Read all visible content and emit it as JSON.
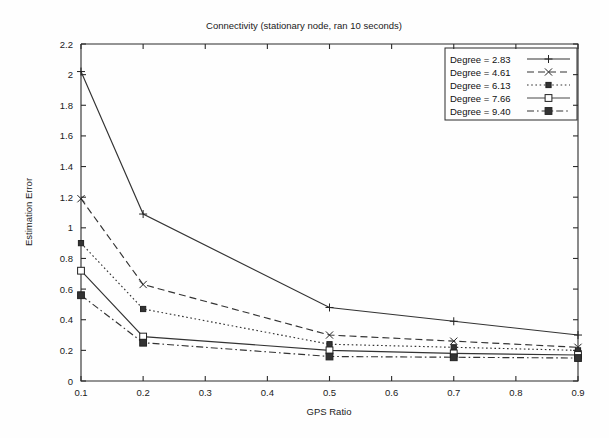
{
  "chart_data": {
    "type": "line",
    "title": "Connectivity (stationary node, ran 10 seconds)",
    "xlabel": "GPS Ratio",
    "ylabel": "Estimation Error",
    "x": [
      0.1,
      0.2,
      0.5,
      0.7,
      0.9
    ],
    "xlim": [
      0.1,
      0.9
    ],
    "ylim": [
      0,
      2.2
    ],
    "xticks": [
      "0.1",
      "0.2",
      "0.3",
      "0.4",
      "0.5",
      "0.6",
      "0.7",
      "0.8",
      "0.9"
    ],
    "xtick_values": [
      0.1,
      0.2,
      0.3,
      0.4,
      0.5,
      0.6,
      0.7,
      0.8,
      0.9
    ],
    "yticks": [
      "0",
      "0.2",
      "0.4",
      "0.6",
      "0.8",
      "1",
      "1.2",
      "1.4",
      "1.6",
      "1.8",
      "2",
      "2.2"
    ],
    "ytick_values": [
      0,
      0.2,
      0.4,
      0.6,
      0.8,
      1.0,
      1.2,
      1.4,
      1.6,
      1.8,
      2.0,
      2.2
    ],
    "grid": false,
    "legend_position": "top-right",
    "series": [
      {
        "name": "Degree = 2.83",
        "values": [
          2.02,
          1.09,
          0.48,
          0.39,
          0.3
        ],
        "dash": "none",
        "marker": "plus",
        "color": "#333333"
      },
      {
        "name": "Degree = 4.61",
        "values": [
          1.19,
          0.63,
          0.3,
          0.26,
          0.22
        ],
        "dash": "dashed",
        "marker": "cross",
        "color": "#333333"
      },
      {
        "name": "Degree = 6.13",
        "values": [
          0.9,
          0.47,
          0.24,
          0.22,
          0.2
        ],
        "dash": "dotted",
        "marker": "filled-square-small",
        "color": "#333333"
      },
      {
        "name": "Degree = 7.66",
        "values": [
          0.72,
          0.29,
          0.2,
          0.18,
          0.17
        ],
        "dash": "solid-thin",
        "marker": "open-square",
        "color": "#333333"
      },
      {
        "name": "Degree = 9.40",
        "values": [
          0.56,
          0.25,
          0.16,
          0.155,
          0.15
        ],
        "dash": "dashdot",
        "marker": "filled-square",
        "color": "#333333"
      }
    ]
  }
}
